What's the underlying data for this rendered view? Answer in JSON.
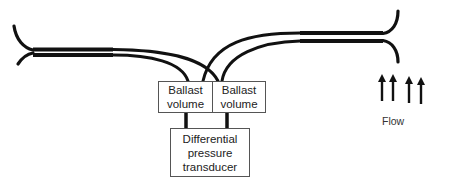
{
  "diagram": {
    "ballast_left": {
      "line1": "Ballast",
      "line2": "volume"
    },
    "ballast_right": {
      "line1": "Ballast",
      "line2": "volume"
    },
    "transducer": {
      "line1": "Differential",
      "line2": "pressure",
      "line3": "transducer"
    },
    "flow_label": "Flow",
    "flow_arrow_count": 4,
    "colors": {
      "line": "#111111",
      "box_border": "#555555",
      "text": "#222222"
    }
  }
}
